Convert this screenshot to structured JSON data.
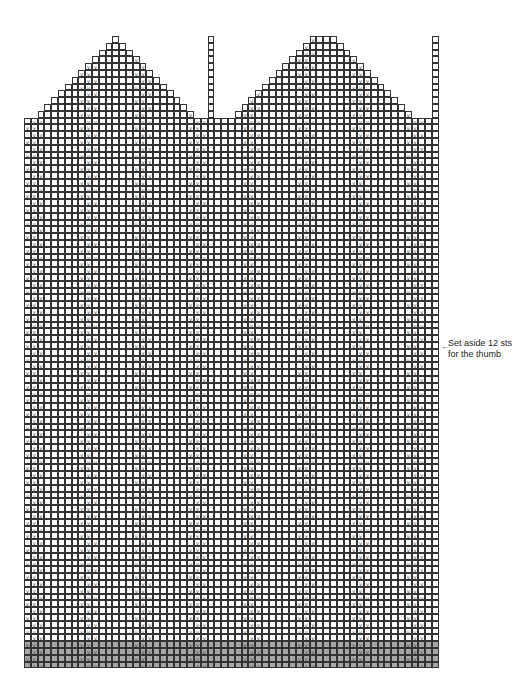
{
  "chart": {
    "type": "knitting-chart",
    "cell_size": 6.8,
    "origin_x": 24,
    "origin_y": 36,
    "columns": 61,
    "rows": 93,
    "stitch_symbol": "v",
    "gray_color": "#a6a6a6",
    "gray_rows_from_bottom": 4,
    "left_triangle_apex_col": 13,
    "right_triangle_top_cols": [
      42,
      45
    ],
    "body_full_width_start_row": 12,
    "pillar_columns": [
      27,
      60
    ]
  },
  "annotation": {
    "arrow": "←",
    "line1": "Set aside 12 sts",
    "line2": "for the thumb"
  }
}
